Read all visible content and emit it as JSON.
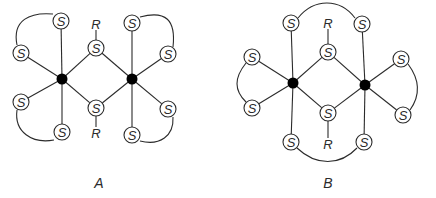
{
  "figure": {
    "width": 436,
    "height": 198,
    "colors": {
      "line": "#2b2b2b",
      "metal": "#000000",
      "background": "#ffffff"
    },
    "s_radius": 8,
    "metal_radius": 5.5,
    "panels": [
      {
        "id": "A",
        "caption": "A",
        "caption_pos": [
          99,
          183
        ],
        "metals": [
          {
            "id": "M1",
            "x": 62,
            "y": 79
          },
          {
            "id": "M2",
            "x": 132,
            "y": 79
          }
        ],
        "sulfurs": [
          {
            "id": "s_tl",
            "label": "S",
            "x": 61,
            "y": 21,
            "metal": "M1"
          },
          {
            "id": "s_lu",
            "label": "S",
            "x": 21,
            "y": 53,
            "metal": "M1"
          },
          {
            "id": "s_ll",
            "label": "S",
            "x": 21,
            "y": 102,
            "metal": "M1"
          },
          {
            "id": "s_bl",
            "label": "S",
            "x": 62,
            "y": 132,
            "metal": "M1"
          },
          {
            "id": "s_bt",
            "label": "S",
            "x": 96,
            "y": 48,
            "metal": "M1,M2",
            "bridge": true
          },
          {
            "id": "s_bb",
            "label": "S",
            "x": 96,
            "y": 108,
            "metal": "M1,M2",
            "bridge": true
          },
          {
            "id": "s_tr",
            "label": "S",
            "x": 132,
            "y": 23,
            "metal": "M2"
          },
          {
            "id": "s_ru",
            "label": "S",
            "x": 168,
            "y": 54,
            "metal": "M2"
          },
          {
            "id": "s_rl",
            "label": "S",
            "x": 168,
            "y": 109,
            "metal": "M2"
          },
          {
            "id": "s_br",
            "label": "S",
            "x": 132,
            "y": 135,
            "metal": "M2"
          }
        ],
        "r_groups": [
          {
            "label": "R",
            "x": 96,
            "y": 24,
            "attached_to": "s_bt"
          },
          {
            "label": "R",
            "x": 96,
            "y": 133,
            "attached_to": "s_bb"
          }
        ],
        "chelate_loops": [
          {
            "from": "s_lu",
            "to": "s_tl",
            "path": "M 17 45 C 12 20, 30 12, 53 14"
          },
          {
            "from": "s_ll",
            "to": "s_bl",
            "path": "M 17 110 C 14 132, 32 144, 54 140"
          },
          {
            "from": "s_tr",
            "to": "s_ru",
            "path": "M 140 17 C 166 10, 176 20, 173 47"
          },
          {
            "from": "s_br",
            "to": "s_rl",
            "path": "M 140 141 C 160 146, 174 136, 173 117"
          }
        ]
      },
      {
        "id": "B",
        "caption": "B",
        "caption_pos": [
          328,
          183
        ],
        "metals": [
          {
            "id": "M1",
            "x": 293,
            "y": 83
          },
          {
            "id": "M2",
            "x": 365,
            "y": 85
          }
        ],
        "sulfurs": [
          {
            "id": "s_tl",
            "label": "S",
            "x": 291,
            "y": 23,
            "metal": "M1"
          },
          {
            "id": "s_lu",
            "label": "S",
            "x": 252,
            "y": 57,
            "metal": "M1"
          },
          {
            "id": "s_ll",
            "label": "S",
            "x": 252,
            "y": 108,
            "metal": "M1"
          },
          {
            "id": "s_bl",
            "label": "S",
            "x": 291,
            "y": 142,
            "metal": "M1"
          },
          {
            "id": "s_bt",
            "label": "S",
            "x": 328,
            "y": 52,
            "metal": "M1,M2",
            "bridge": true
          },
          {
            "id": "s_bb",
            "label": "S",
            "x": 328,
            "y": 113,
            "metal": "M1,M2",
            "bridge": true
          },
          {
            "id": "s_tr",
            "label": "S",
            "x": 362,
            "y": 24,
            "metal": "M2"
          },
          {
            "id": "s_ru",
            "label": "S",
            "x": 401,
            "y": 59,
            "metal": "M2"
          },
          {
            "id": "s_rl",
            "label": "S",
            "x": 403,
            "y": 115,
            "metal": "M2"
          },
          {
            "id": "s_br",
            "label": "S",
            "x": 364,
            "y": 142,
            "metal": "M2"
          }
        ],
        "r_groups": [
          {
            "label": "R",
            "x": 328,
            "y": 23,
            "attached_to": "s_bt"
          },
          {
            "label": "R",
            "x": 328,
            "y": 144,
            "attached_to": "s_bb"
          }
        ],
        "chelate_loops": [
          {
            "from": "s_tl",
            "to": "s_tr",
            "path": "M 298 18 C 314 -2, 340 -2, 355 18"
          },
          {
            "from": "s_lu",
            "to": "s_ll",
            "path": "M 246 63 C 234 78, 234 90, 246 102"
          },
          {
            "from": "s_ru",
            "to": "s_rl",
            "path": "M 408 64 C 420 80, 420 96, 410 110"
          },
          {
            "from": "s_bl",
            "to": "s_br",
            "path": "M 297 148 C 316 166, 340 166, 357 148"
          }
        ]
      }
    ]
  }
}
